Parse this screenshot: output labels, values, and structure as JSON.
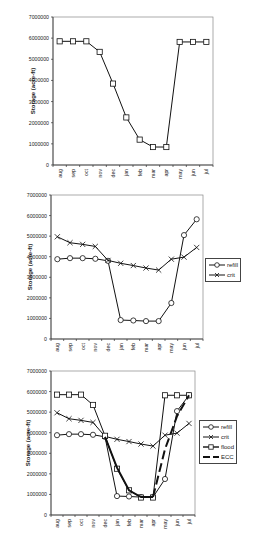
{
  "chart_data": [
    {
      "type": "line",
      "title": "",
      "xlabel": "",
      "ylabel": "Storage (acre-ft)",
      "ylim": [
        0,
        7000000
      ],
      "yticks": [
        0,
        1000000,
        2000000,
        3000000,
        4000000,
        5000000,
        6000000,
        7000000
      ],
      "grid": false,
      "legend": null,
      "categories": [
        "aug",
        "sep",
        "oct",
        "nov",
        "dec",
        "jan",
        "feb",
        "mar",
        "apr",
        "may",
        "jun",
        "jul"
      ],
      "series": [
        {
          "name": "flood",
          "marker": "square",
          "values": [
            5850000,
            5850000,
            5850000,
            5350000,
            3850000,
            2250000,
            1200000,
            850000,
            850000,
            5820000,
            5820000,
            5820000
          ]
        }
      ]
    },
    {
      "type": "line",
      "title": "",
      "xlabel": "",
      "ylabel": "Storage (acre-ft)",
      "ylim": [
        0,
        7000000
      ],
      "yticks": [
        0,
        1000000,
        2000000,
        3000000,
        4000000,
        5000000,
        6000000,
        7000000
      ],
      "grid": false,
      "legend": "right",
      "categories": [
        "aug",
        "sep",
        "oct",
        "nov",
        "dec",
        "jan",
        "feb",
        "mar",
        "apr",
        "may",
        "jun",
        "jul"
      ],
      "series": [
        {
          "name": "refill",
          "marker": "circle",
          "values": [
            3880000,
            3930000,
            3930000,
            3900000,
            3800000,
            920000,
            900000,
            870000,
            870000,
            1750000,
            5050000,
            5820000
          ]
        },
        {
          "name": "crit",
          "marker": "x",
          "values": [
            4970000,
            4680000,
            4600000,
            4500000,
            3820000,
            3680000,
            3570000,
            3450000,
            3350000,
            3880000,
            3980000,
            4450000
          ]
        }
      ]
    },
    {
      "type": "line",
      "title": "",
      "xlabel": "",
      "ylabel": "Storage (acre-ft)",
      "ylim": [
        0,
        7000000
      ],
      "yticks": [
        0,
        1000000,
        2000000,
        3000000,
        4000000,
        5000000,
        6000000,
        7000000
      ],
      "grid": false,
      "legend": "right",
      "categories": [
        "aug",
        "sep",
        "oct",
        "nov",
        "dec",
        "jan",
        "feb",
        "mar",
        "apr",
        "may",
        "jun",
        "jul"
      ],
      "series": [
        {
          "name": "refill",
          "marker": "circle",
          "values": [
            3880000,
            3930000,
            3930000,
            3900000,
            3800000,
            920000,
            900000,
            870000,
            870000,
            1750000,
            5050000,
            5820000
          ]
        },
        {
          "name": "crit",
          "marker": "x",
          "values": [
            4970000,
            4680000,
            4600000,
            4500000,
            3820000,
            3680000,
            3570000,
            3450000,
            3350000,
            3880000,
            3980000,
            4450000
          ]
        },
        {
          "name": "flood",
          "marker": "square",
          "values": [
            5850000,
            5850000,
            5850000,
            5350000,
            3850000,
            2250000,
            1200000,
            850000,
            850000,
            5820000,
            5820000,
            5820000
          ]
        },
        {
          "name": "ECC",
          "marker": "none",
          "style": "thick-dashed",
          "values": [
            null,
            null,
            null,
            null,
            3800000,
            2300000,
            1200000,
            870000,
            870000,
            3200000,
            4800000,
            5820000
          ]
        }
      ]
    }
  ],
  "charts": [
    {
      "ylabel": "Storage (acre-ft)",
      "ytick_labels": [
        "0",
        "1000000",
        "2000000",
        "3000000",
        "4000000",
        "5000000",
        "6000000",
        "7000000"
      ],
      "legend": []
    },
    {
      "ylabel": "Storage (acre-ft)",
      "ytick_labels": [
        "0",
        "1000000",
        "2000000",
        "3000000",
        "4000000",
        "5000000",
        "6000000",
        "7000000"
      ],
      "legend": [
        "refill",
        "crit"
      ]
    },
    {
      "ylabel": "Storage (acre-ft)",
      "ytick_labels": [
        "0",
        "1000000",
        "2000000",
        "3000000",
        "4000000",
        "5000000",
        "6000000",
        "7000000"
      ],
      "legend": [
        "refill",
        "crit",
        "flood",
        "ECC"
      ]
    }
  ],
  "colors": {
    "line": "#111111",
    "axis": "#333333",
    "plot_border": "#888888",
    "background": "#ffffff"
  }
}
